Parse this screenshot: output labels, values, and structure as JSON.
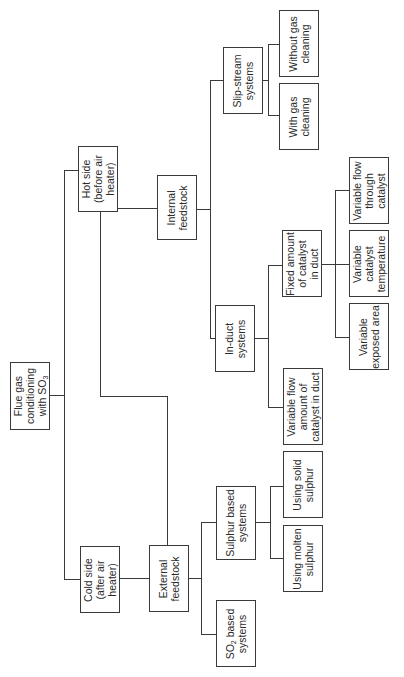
{
  "diagram": {
    "title": "Flue gas conditioning with SO3",
    "orientation": "rotated -90deg",
    "nodes": {
      "root": {
        "lines": [
          "Flue gas",
          "conditioning",
          "with SO",
          "3"
        ],
        "box": [
          10,
          362,
          40,
          68
        ]
      },
      "hot_side": {
        "lines": [
          "Hot side",
          "(before air",
          "heater)"
        ],
        "box": [
          78,
          146,
          40,
          66
        ]
      },
      "cold_side": {
        "lines": [
          "Cold side",
          "(after air",
          "heater)"
        ],
        "box": [
          80,
          546,
          40,
          67
        ]
      },
      "internal_feedstock": {
        "lines": [
          "Internal",
          "feedstock"
        ],
        "box": [
          157,
          175,
          40,
          65
        ]
      },
      "external_feedstock": {
        "lines": [
          "External",
          "feedstock"
        ],
        "box": [
          149,
          545,
          40,
          67
        ]
      },
      "slip_stream": {
        "lines": [
          "Slip-stream",
          "systems"
        ],
        "box": [
          223,
          47,
          40,
          67
        ]
      },
      "in_duct": {
        "lines": [
          "In-duct",
          "systems"
        ],
        "box": [
          215,
          305,
          40,
          67
        ]
      },
      "so2_based": {
        "lines": [
          "SO",
          "2",
          " based",
          "systems"
        ],
        "box": [
          216,
          600,
          40,
          67
        ]
      },
      "sulphur_based": {
        "lines": [
          "Sulphur based",
          "systems"
        ],
        "box": [
          216,
          486,
          40,
          74
        ]
      },
      "without_gas_cleaning": {
        "lines": [
          "Without gas",
          "cleaning"
        ],
        "box": [
          279,
          10,
          40,
          67
        ]
      },
      "with_gas_cleaning": {
        "lines": [
          "With gas",
          "cleaning"
        ],
        "box": [
          279,
          83,
          40,
          67
        ]
      },
      "fixed_amount": {
        "lines": [
          "Fixed amount",
          "of catalyst",
          "in duct"
        ],
        "box": [
          282,
          230,
          40,
          67
        ]
      },
      "variable_flow_amount": {
        "lines": [
          "Variable flow",
          "amount of",
          "catalyst in duct"
        ],
        "box": [
          283,
          368,
          40,
          77
        ]
      },
      "using_solid_sulphur": {
        "lines": [
          "Using solid",
          "sulphur"
        ],
        "box": [
          283,
          451,
          40,
          67
        ]
      },
      "using_molten_sulphur": {
        "lines": [
          "Using molten",
          "sulphur"
        ],
        "box": [
          283,
          525,
          40,
          67
        ]
      },
      "variable_flow_through": {
        "lines": [
          "Variable flow",
          "through",
          "catalyst"
        ],
        "box": [
          349,
          157,
          40,
          67
        ]
      },
      "variable_catalyst_temperature": {
        "lines": [
          "Variable",
          "catalyst",
          "temperature"
        ],
        "box": [
          349,
          230,
          40,
          67
        ]
      },
      "variable_exposed_area": {
        "lines": [
          "Variable",
          "exposed area"
        ],
        "box": [
          349,
          303,
          40,
          67
        ]
      }
    },
    "edges": [
      [
        "root",
        "hot_side"
      ],
      [
        "root",
        "cold_side"
      ],
      [
        "hot_side",
        "internal_feedstock"
      ],
      [
        "hot_side",
        "external_feedstock"
      ],
      [
        "cold_side",
        "external_feedstock"
      ],
      [
        "internal_feedstock",
        "slip_stream"
      ],
      [
        "internal_feedstock",
        "in_duct"
      ],
      [
        "slip_stream",
        "without_gas_cleaning"
      ],
      [
        "slip_stream",
        "with_gas_cleaning"
      ],
      [
        "in_duct",
        "fixed_amount"
      ],
      [
        "in_duct",
        "variable_flow_amount"
      ],
      [
        "fixed_amount",
        "variable_flow_through"
      ],
      [
        "fixed_amount",
        "variable_catalyst_temperature"
      ],
      [
        "fixed_amount",
        "variable_exposed_area"
      ],
      [
        "external_feedstock",
        "sulphur_based"
      ],
      [
        "external_feedstock",
        "so2_based"
      ],
      [
        "sulphur_based",
        "using_solid_sulphur"
      ],
      [
        "sulphur_based",
        "using_molten_sulphur"
      ]
    ],
    "line_color": "#3a3a3a"
  }
}
